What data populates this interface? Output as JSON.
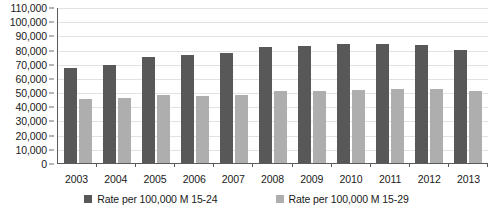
{
  "chart_data": {
    "type": "bar",
    "title": "",
    "subtitle": "",
    "xlabel": "",
    "ylabel": "",
    "categories": [
      "2003",
      "2004",
      "2005",
      "2006",
      "2007",
      "2008",
      "2009",
      "2010",
      "2011",
      "2012",
      "2013"
    ],
    "series": [
      {
        "name": "Rate per 100,000 M 15-24",
        "color": "#585858",
        "values": [
          67000,
          69000,
          74500,
          76500,
          77500,
          81500,
          82500,
          84000,
          84000,
          83500,
          80000
        ]
      },
      {
        "name": "Rate per 100,000 M 15-29",
        "color": "#aeaeae",
        "values": [
          45000,
          45500,
          48000,
          47500,
          48000,
          50500,
          50500,
          51500,
          52000,
          52000,
          51000
        ]
      }
    ],
    "ylim": [
      0,
      110000
    ],
    "ytick_step": 10000,
    "ytick_labels": [
      "110,000",
      "100,000",
      "90,000",
      "80,000",
      "70,000",
      "60,000",
      "50,000",
      "40,000",
      "30,000",
      "20,000",
      "10,000",
      "0"
    ],
    "grid": true,
    "legend_position": "bottom"
  }
}
